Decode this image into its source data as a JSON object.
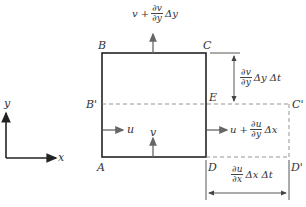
{
  "diagram": {
    "type": "fluid element deformation (continuity)",
    "axes": {
      "x_label": "x",
      "y_label": "y"
    },
    "points": {
      "A": "A",
      "B": "B",
      "C": "C",
      "D": "D",
      "E": "E",
      "B_prime": "B'",
      "C_prime": "C'",
      "D_prime": "D'"
    },
    "velocity_labels": {
      "u_left": "u",
      "v_bottom": "v",
      "top_prefix": "v +",
      "top_num": "∂v",
      "top_den": "∂y",
      "top_suffix": "Δy",
      "right_prefix": "u +",
      "right_num": "∂u",
      "right_den": "∂y",
      "right_suffix": "Δx"
    },
    "dimensions": {
      "vertical_num": "∂v",
      "vertical_den": "∂y",
      "vertical_suffix": "Δy Δt",
      "horizontal_num": "∂u",
      "horizontal_den": "∂x",
      "horizontal_suffix": "Δx Δt"
    },
    "colors": {
      "box": "#222222",
      "arrows": "#666666",
      "dashed": "#888888"
    }
  }
}
